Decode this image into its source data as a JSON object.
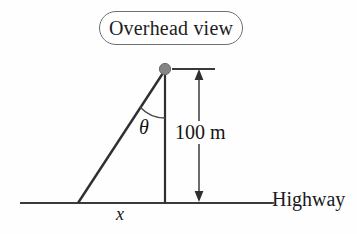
{
  "figure": {
    "type": "geometry-diagram",
    "width": 357,
    "height": 234,
    "background_color": "#fefefe",
    "line_color": "#3a3a3a",
    "point_color": "#808080"
  },
  "callout": {
    "label": "Overhead view",
    "shape": "rounded-rectangle",
    "border_color": "#6f6f6f"
  },
  "diagram": {
    "observer_point_name": "observer-point",
    "angle_label": "θ",
    "height_label": "100 m",
    "base_label": "x",
    "baseline_label": "Highway",
    "geometry": {
      "apex": [
        165,
        70
      ],
      "base_left": [
        78,
        203
      ],
      "base_right": [
        165,
        203
      ],
      "baseline_start": [
        20,
        203
      ],
      "baseline_end": [
        272,
        203
      ],
      "dimension_line_x": 199,
      "dimension_top_y": 70,
      "dimension_bottom_y": 203
    }
  }
}
